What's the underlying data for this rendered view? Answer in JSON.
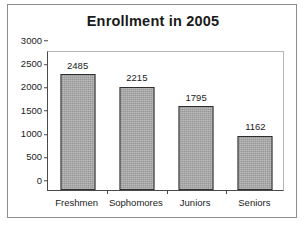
{
  "chart_data": {
    "type": "bar",
    "title": "Enrollment in 2005",
    "xlabel": "",
    "ylabel": "",
    "categories": [
      "Freshmen",
      "Sophomores",
      "Juniors",
      "Seniors"
    ],
    "values": [
      2485,
      2215,
      1795,
      1162
    ],
    "value_labels": [
      "2485",
      "2215",
      "1795",
      "1162"
    ],
    "ylim": [
      0,
      3000
    ],
    "ytick_step": 500,
    "yticks": [
      0,
      500,
      1000,
      1500,
      2000,
      2500,
      3000
    ],
    "ytick_labels": [
      "0",
      "500",
      "1000",
      "1500",
      "2000",
      "2500",
      "3000"
    ],
    "grid": false,
    "legend": false,
    "series": [
      {
        "name": "Enrollment",
        "values": [
          2485,
          2215,
          1795,
          1162
        ]
      }
    ],
    "colors": {
      "bar_fill": "#a8a8a8",
      "bar_outline": "#2f2f2f",
      "axis": "#4a4a4a",
      "text": "#1a1a1a",
      "frame": "#8d8d8d",
      "background": "#ffffff"
    }
  }
}
